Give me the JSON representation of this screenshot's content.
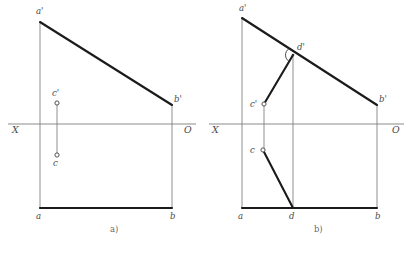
{
  "figure": {
    "background_color": "#ffffff",
    "ink_color": "#1b1b1b",
    "thin_color": "#7b7b7b",
    "axis_color": "#8c8c8c",
    "width": 414,
    "height": 255
  },
  "axis": {
    "x_label": "X",
    "o_label": "O",
    "y": 124
  },
  "panels": [
    {
      "id": "a",
      "caption": "a)",
      "caption_x": 110,
      "caption_y": 232,
      "frame": {
        "left_x": 40,
        "right_x": 172,
        "base_y": 208,
        "top_left_y": 22,
        "top_right_y": 105
      },
      "axis": {
        "start_x": 8,
        "end_x": 196,
        "x_label_x": 12,
        "x_label_y": 133,
        "o_label_x": 184,
        "o_label_y": 133
      },
      "vertices": [
        {
          "name": "a-prime",
          "label": "a'",
          "x": 40,
          "y": 22,
          "label_x": 36,
          "label_y": 14,
          "marker": "none"
        },
        {
          "name": "b-prime",
          "label": "b'",
          "x": 172,
          "y": 105,
          "label_x": 174,
          "label_y": 102,
          "marker": "none"
        },
        {
          "name": "a",
          "label": "a",
          "x": 40,
          "y": 208,
          "label_x": 36,
          "label_y": 219,
          "marker": "none"
        },
        {
          "name": "b",
          "label": "b",
          "x": 172,
          "y": 208,
          "label_x": 170,
          "label_y": 219,
          "marker": "none"
        },
        {
          "name": "c-prime",
          "label": "c'",
          "x": 57,
          "y": 103,
          "label_x": 52,
          "label_y": 96,
          "marker": "circle"
        },
        {
          "name": "c",
          "label": "c",
          "x": 57,
          "y": 155,
          "label_x": 53,
          "label_y": 166,
          "marker": "circle"
        }
      ],
      "thick_edges": [
        {
          "name": "edge-a-prime-b-prime",
          "x1": 40,
          "y1": 22,
          "x2": 172,
          "y2": 105
        },
        {
          "name": "edge-a-b",
          "x1": 40,
          "y1": 208,
          "x2": 172,
          "y2": 208
        }
      ],
      "thin_edges": [
        {
          "name": "projector-a",
          "x1": 40,
          "y1": 22,
          "x2": 40,
          "y2": 208
        },
        {
          "name": "projector-b",
          "x1": 172,
          "y1": 105,
          "x2": 172,
          "y2": 208
        },
        {
          "name": "projector-c",
          "x1": 57,
          "y1": 103,
          "x2": 57,
          "y2": 155
        }
      ],
      "right_angle_marker": null
    },
    {
      "id": "b",
      "caption": "b)",
      "caption_x": 314,
      "caption_y": 232,
      "frame": {
        "left_x": 242,
        "right_x": 377,
        "base_y": 208,
        "top_left_y": 18,
        "top_right_y": 105
      },
      "axis": {
        "start_x": 209,
        "end_x": 404,
        "x_label_x": 212,
        "x_label_y": 133,
        "o_label_x": 392,
        "o_label_y": 133
      },
      "vertices": [
        {
          "name": "a-prime",
          "label": "a'",
          "x": 242,
          "y": 18,
          "label_x": 239,
          "label_y": 11,
          "marker": "none"
        },
        {
          "name": "b-prime",
          "label": "b'",
          "x": 377,
          "y": 105,
          "label_x": 379,
          "label_y": 102,
          "marker": "none"
        },
        {
          "name": "a",
          "label": "a",
          "x": 242,
          "y": 208,
          "label_x": 238,
          "label_y": 219,
          "marker": "none"
        },
        {
          "name": "b",
          "label": "b",
          "x": 377,
          "y": 208,
          "label_x": 375,
          "label_y": 219,
          "marker": "none"
        },
        {
          "name": "d-prime",
          "label": "d'",
          "x": 293,
          "y": 55,
          "label_x": 297,
          "label_y": 50,
          "marker": "none"
        },
        {
          "name": "d",
          "label": "d",
          "x": 293,
          "y": 208,
          "label_x": 289,
          "label_y": 219,
          "marker": "none"
        },
        {
          "name": "c-prime",
          "label": "c'",
          "x": 264,
          "y": 104,
          "label_x": 250,
          "label_y": 107,
          "marker": "circle"
        },
        {
          "name": "c",
          "label": "c",
          "x": 263,
          "y": 150,
          "label_x": 250,
          "label_y": 153,
          "marker": "circle"
        }
      ],
      "thick_edges": [
        {
          "name": "edge-a-prime-b-prime",
          "x1": 242,
          "y1": 18,
          "x2": 377,
          "y2": 105
        },
        {
          "name": "edge-a-b",
          "x1": 242,
          "y1": 208,
          "x2": 377,
          "y2": 208
        },
        {
          "name": "edge-c-prime-d-prime",
          "x1": 264,
          "y1": 104,
          "x2": 293,
          "y2": 55
        },
        {
          "name": "edge-c-d",
          "x1": 263,
          "y1": 150,
          "x2": 293,
          "y2": 208
        }
      ],
      "thin_edges": [
        {
          "name": "projector-a",
          "x1": 242,
          "y1": 18,
          "x2": 242,
          "y2": 208
        },
        {
          "name": "projector-b",
          "x1": 377,
          "y1": 105,
          "x2": 377,
          "y2": 208
        },
        {
          "name": "projector-c",
          "x1": 264,
          "y1": 104,
          "x2": 264,
          "y2": 150
        },
        {
          "name": "projector-d",
          "x1": 293,
          "y1": 55,
          "x2": 293,
          "y2": 208
        }
      ],
      "right_angle_marker": {
        "name": "right-angle-marker",
        "cx": 293,
        "cy": 55,
        "r": 7.5,
        "dot_r": 1.3,
        "start_angle": 120,
        "end_angle": 238
      }
    }
  ]
}
